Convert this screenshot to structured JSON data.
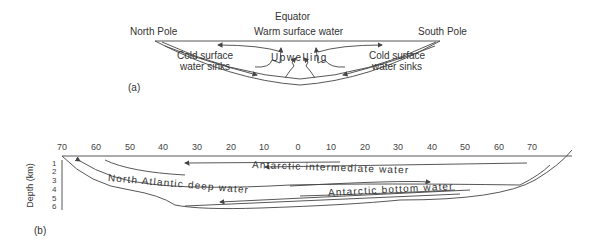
{
  "panel_a": {
    "tag": "(a)",
    "equator": "Equator",
    "warm": "Warm surface water",
    "north_pole": "North Pole",
    "south_pole": "South Pole",
    "left_sink_1": "Cold surface",
    "left_sink_2": "water sinks",
    "right_sink_1": "Cold surface",
    "right_sink_2": "water sinks",
    "upwelling": "Upwelling"
  },
  "panel_b": {
    "tag": "(b)",
    "y_axis_label": "Depth (km)",
    "depth_ticks": [
      "1",
      "2",
      "3",
      "4",
      "5",
      "6"
    ],
    "lat_ticks": [
      "70",
      "60",
      "50",
      "40",
      "30",
      "20",
      "10",
      "0",
      "10",
      "20",
      "30",
      "40",
      "50",
      "60",
      "70"
    ],
    "intermediate": "Antarctic intermediate water",
    "nadw": "North Atlantic deep water",
    "bottom": "Antarctic bottom water"
  }
}
